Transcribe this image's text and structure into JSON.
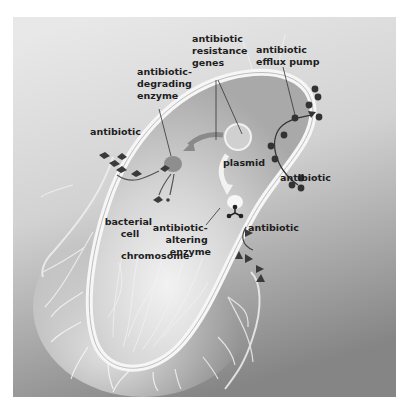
{
  "figure": {
    "colors": {
      "background_top": "#e8e8e8",
      "background_bottom": "#858585",
      "cell_fill": "#c9c9c9",
      "cell_wall": "#f4f4f4",
      "molecule": "#3a3a3a",
      "enzyme": "#8e8e8e",
      "label_text": "#1e1e1e"
    },
    "labels": {
      "resistance_genes": [
        "antibiotic",
        "resistance",
        "genes"
      ],
      "efflux_pump": [
        "antibiotic",
        "efflux pump"
      ],
      "degrading_enzyme": [
        "antibiotic-",
        "degrading",
        "enzyme"
      ],
      "antibiotic_left": "antibiotic",
      "plasmid": "plasmid",
      "antibiotic_right_upper": "antibiotic",
      "altering_enzyme": [
        "antibiotic-",
        "altering",
        "enzyme"
      ],
      "antibiotic_right_lower": "antibiotic",
      "bacterial_cell": [
        "bacterial",
        "cell"
      ],
      "chromosome": "chromosome"
    },
    "molecules": {
      "diamonds": "antibiotic (degraded by enzyme)",
      "circles": "antibiotic (pumped out)",
      "triangles": "antibiotic (altered by enzyme)"
    }
  }
}
